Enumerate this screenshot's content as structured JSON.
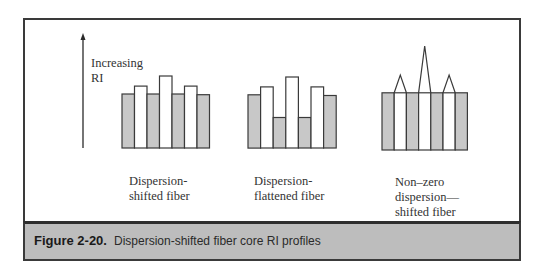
{
  "axis": {
    "label": "Increasing\nRI",
    "arrow_icon": "up-arrow"
  },
  "colors": {
    "cladding_fill": "#c8c8c8",
    "core_fill": "#ffffff",
    "stroke": "#3a3a3a",
    "caption_band": "#bdbdbd"
  },
  "profiles": [
    {
      "name": "dispersion-shifted",
      "label": "Dispersion-\nshifted fiber",
      "bars": [
        {
          "fill": "gray",
          "level": 0.75
        },
        {
          "fill": "white",
          "level": 0.86
        },
        {
          "fill": "gray",
          "level": 0.75
        },
        {
          "fill": "white",
          "level": 1.0
        },
        {
          "fill": "gray",
          "level": 0.75
        },
        {
          "fill": "white",
          "level": 0.86
        },
        {
          "fill": "gray",
          "level": 0.74
        }
      ]
    },
    {
      "name": "dispersion-flattened",
      "label": "Dispersion-\nflattened fiber",
      "bars": [
        {
          "fill": "gray",
          "level": 0.75
        },
        {
          "fill": "white",
          "level": 0.86
        },
        {
          "fill": "gray",
          "level": 0.43
        },
        {
          "fill": "white",
          "level": 1.0
        },
        {
          "fill": "gray",
          "level": 0.43
        },
        {
          "fill": "white",
          "level": 0.86
        },
        {
          "fill": "gray",
          "level": 0.74
        }
      ]
    },
    {
      "name": "non-zero-dispersion-shifted",
      "label": "Non–zero\ndispersion—\nshifted fiber",
      "bars": [
        {
          "fill": "gray",
          "level": 0.55
        },
        {
          "fill": "white",
          "level": 0.55,
          "peak": 0.72
        },
        {
          "fill": "gray",
          "level": 0.55
        },
        {
          "fill": "white",
          "level": 0.55,
          "peak": 1.0
        },
        {
          "fill": "gray",
          "level": 0.55
        },
        {
          "fill": "white",
          "level": 0.55,
          "peak": 0.72
        },
        {
          "fill": "gray",
          "level": 0.55
        }
      ]
    }
  ],
  "caption": {
    "number": "Figure 2-20.",
    "text": "Dispersion-shifted fiber core RI profiles"
  }
}
